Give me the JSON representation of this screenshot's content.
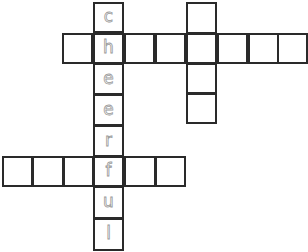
{
  "puzzle": {
    "type": "crossword",
    "cell_size": 31,
    "colors": {
      "border": "#2a2a2a",
      "letter": "#9a9a9a",
      "background": "#ffffff"
    },
    "words": [
      {
        "id": "down-1",
        "direction": "down",
        "answer": "cheerful"
      },
      {
        "id": "across-1",
        "direction": "across",
        "length": 8
      },
      {
        "id": "down-2",
        "direction": "down",
        "length": 4
      },
      {
        "id": "across-2",
        "direction": "across",
        "length": 6
      }
    ],
    "cells": [
      {
        "x": 93,
        "y": 2,
        "w": 31,
        "h": 31,
        "letter": "c"
      },
      {
        "x": 62,
        "y": 33,
        "w": 31,
        "h": 31,
        "letter": ""
      },
      {
        "x": 93,
        "y": 33,
        "w": 31,
        "h": 31,
        "letter": "h"
      },
      {
        "x": 124,
        "y": 33,
        "w": 31,
        "h": 31,
        "letter": ""
      },
      {
        "x": 155,
        "y": 33,
        "w": 31,
        "h": 31,
        "letter": ""
      },
      {
        "x": 186,
        "y": 33,
        "w": 31,
        "h": 31,
        "letter": ""
      },
      {
        "x": 217,
        "y": 33,
        "w": 31,
        "h": 31,
        "letter": ""
      },
      {
        "x": 248,
        "y": 33,
        "w": 31,
        "h": 31,
        "letter": ""
      },
      {
        "x": 277,
        "y": 33,
        "w": 31,
        "h": 31,
        "letter": ""
      },
      {
        "x": 186,
        "y": 2,
        "w": 31,
        "h": 32,
        "letter": ""
      },
      {
        "x": 186,
        "y": 63,
        "w": 31,
        "h": 31,
        "letter": ""
      },
      {
        "x": 186,
        "y": 93,
        "w": 31,
        "h": 31,
        "letter": ""
      },
      {
        "x": 93,
        "y": 63,
        "w": 31,
        "h": 32,
        "letter": "e"
      },
      {
        "x": 93,
        "y": 94,
        "w": 31,
        "h": 32,
        "letter": "e"
      },
      {
        "x": 93,
        "y": 125,
        "w": 31,
        "h": 32,
        "letter": "r"
      },
      {
        "x": 2,
        "y": 156,
        "w": 31,
        "h": 31,
        "letter": ""
      },
      {
        "x": 32,
        "y": 156,
        "w": 32,
        "h": 31,
        "letter": ""
      },
      {
        "x": 63,
        "y": 156,
        "w": 31,
        "h": 31,
        "letter": ""
      },
      {
        "x": 93,
        "y": 156,
        "w": 31,
        "h": 31,
        "letter": "f"
      },
      {
        "x": 124,
        "y": 156,
        "w": 32,
        "h": 31,
        "letter": ""
      },
      {
        "x": 155,
        "y": 156,
        "w": 31,
        "h": 31,
        "letter": ""
      },
      {
        "x": 93,
        "y": 186,
        "w": 31,
        "h": 33,
        "letter": "u"
      },
      {
        "x": 93,
        "y": 218,
        "w": 31,
        "h": 33,
        "letter": "l"
      }
    ]
  }
}
